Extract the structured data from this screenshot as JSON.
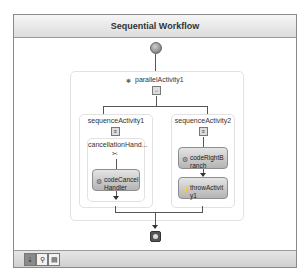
{
  "workflow": {
    "title": "Sequential Workflow",
    "start_icon": "start-circle-icon",
    "end_icon": "stop-square-icon"
  },
  "parallel": {
    "label": "parallelActivity1",
    "icon": "parallel-icon"
  },
  "branches": [
    {
      "label": "sequenceActivity1",
      "cancellation_handler": {
        "label": "cancellationHand...",
        "activity": "codeCancelHandler"
      }
    },
    {
      "label": "sequenceActivity2",
      "activities": [
        "codeRightBranch",
        "throwActivity1"
      ]
    }
  ],
  "activity_text": {
    "code_cancel_l1": "codeCancel",
    "code_cancel_l2": "Handler",
    "code_right_l1": "codeRightB",
    "code_right_l2": "ranch",
    "throw_l1": "throwActivit",
    "throw_l2": "y1"
  },
  "bottom_toolbar": {
    "buttons": [
      {
        "name": "view-workflow",
        "glyph": "⇣",
        "active": true
      },
      {
        "name": "view-cancel-handlers",
        "glyph": "⚲",
        "active": false
      },
      {
        "name": "view-fault-handlers",
        "glyph": "▤",
        "active": false
      }
    ]
  }
}
